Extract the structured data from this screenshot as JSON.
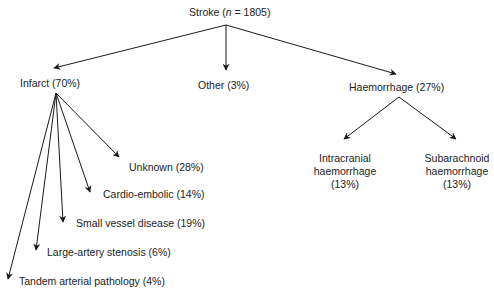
{
  "diagram": {
    "type": "tree",
    "root": {
      "label_prefix": "Stroke (",
      "label_n": "n",
      "label_suffix": " = 1805)"
    },
    "level1": [
      {
        "id": "infarct",
        "label": "Infarct (70%)"
      },
      {
        "id": "other",
        "label": "Other (3%)"
      },
      {
        "id": "haemorrhage",
        "label": "Haemorrhage (27%)"
      }
    ],
    "infarct_children": [
      {
        "id": "unknown",
        "label": "Unknown (28%)"
      },
      {
        "id": "cardio-embolic",
        "label": "Cardio-embolic (14%)"
      },
      {
        "id": "small-vessel",
        "label": "Small vessel disease (19%)"
      },
      {
        "id": "large-artery",
        "label": "Large-artery stenosis (6%)"
      },
      {
        "id": "tandem",
        "label": "Tandem arterial pathology (4%)"
      }
    ],
    "haemorrhage_children": [
      {
        "id": "intracranial",
        "line1": "Intracranial",
        "line2": "haemorrhage",
        "line3": "(13%)"
      },
      {
        "id": "subarachnoid",
        "line1": "Subarachnoid",
        "line2": "haemorrhage",
        "line3": "(13%)"
      }
    ],
    "colors": {
      "line": "#1a1a1a",
      "text": "#222222",
      "background": "#ffffff"
    }
  }
}
